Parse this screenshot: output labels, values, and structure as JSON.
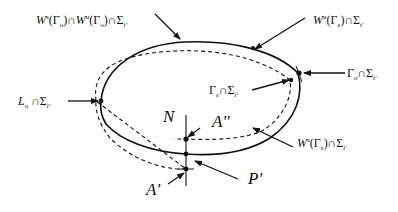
{
  "diagram": {
    "type": "Poincare section of invariant manifolds",
    "curves": {
      "solid": "unstable manifold W^u(Γ_ε) ∩ Σ_t'",
      "dashed": "stable manifold W^s(Γ_ε) ∩ Σ_t'"
    },
    "labels": {
      "top_left": {
        "base1": "W",
        "sup1": "s",
        "paren1_open": "(Γ",
        "sub1": "o",
        "paren1_close": ")∩",
        "base2": "W",
        "sup2": "u",
        "paren2_open": "(Γ",
        "sub2": "o",
        "paren2_close": ")∩Σ",
        "sub3": "t'"
      },
      "top_right": {
        "base": "W",
        "sup": "u",
        "paren_open": "(Γ",
        "sub": "ε",
        "paren_close": ")∩Σ",
        "sub2": "t'"
      },
      "right": {
        "base": "Γ",
        "sub": "o",
        "mid": "∩Σ",
        "sub2": "t'"
      },
      "inner_right": {
        "base": "Γ",
        "sub": "ε",
        "mid": "∩Σ",
        "sub2": "t'"
      },
      "left": {
        "base": "L",
        "sub": "o",
        "mid": " ∩Σ",
        "sub2": "t'"
      },
      "bottom_right": {
        "base": "W",
        "sup": "s",
        "paren_open": "(Γ",
        "sub": "ε",
        "paren_close": ")∩Σ",
        "sub2": "t'"
      },
      "N": "N",
      "A_double_prime": "A''",
      "A_prime": "A'",
      "P_prime": "P'"
    },
    "colors": {
      "ink": "#111111",
      "background": "#ffffff"
    }
  }
}
